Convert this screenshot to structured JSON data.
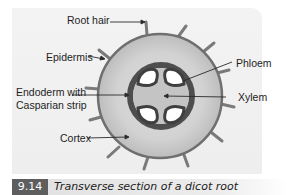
{
  "figure": {
    "number": "9.14",
    "caption": "Transverse section of a dicot root"
  },
  "labels": {
    "root_hair": "Root hair",
    "epidermis": "Epidermis",
    "endoderm_line1": "Endoderm with",
    "endoderm_line2": "Casparian strip",
    "cortex": "Cortex",
    "phloem": "Phloem",
    "xylem": "Xylem"
  },
  "colors": {
    "panel": "#efefef",
    "cortex_fill": "#cfcfcf",
    "epidermis_stroke": "#6f6f6f",
    "endodermis_ring": "#4e4e4e",
    "stele_fill": "#bdbdbd",
    "phloem_fill": "#ffffff",
    "caption_box": "#5e5e5e"
  }
}
